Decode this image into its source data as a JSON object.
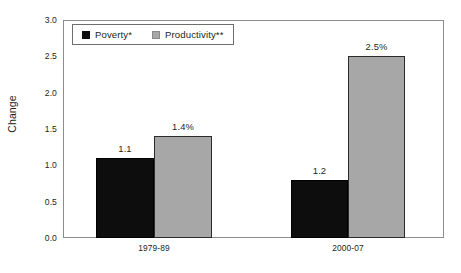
{
  "chart_data": {
    "type": "bar",
    "title": "",
    "xlabel": "",
    "ylabel": "Change",
    "ylim": [
      0.0,
      3.0
    ],
    "ytick_labels": [
      "3.0",
      "2.5",
      "2.0",
      "1.5",
      "1.0",
      "0.5",
      "0.0"
    ],
    "ytick_values": [
      3.0,
      2.5,
      2.0,
      1.5,
      1.0,
      0.5,
      0.0
    ],
    "grid": false,
    "legend_position": "top-left",
    "categories": [
      "1979-89",
      "2000-07"
    ],
    "series": [
      {
        "name": "Poverty*",
        "color": "#0d0d0d",
        "values": [
          1.1,
          0.8
        ],
        "labels": [
          "1.1",
          "1.2"
        ]
      },
      {
        "name": "Productivity**",
        "color": "#a7a7a7",
        "values": [
          1.4,
          2.5
        ],
        "labels": [
          "1.4%",
          "2.5%"
        ]
      }
    ]
  },
  "legend": {
    "items": [
      {
        "label": "Poverty*",
        "swatch": "poverty"
      },
      {
        "label": "Productivity**",
        "swatch": "productivity"
      }
    ]
  }
}
